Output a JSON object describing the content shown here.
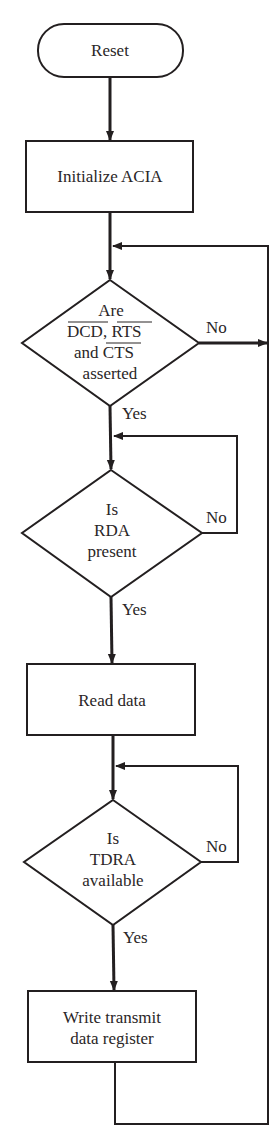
{
  "diagram": {
    "type": "flowchart",
    "nodes": {
      "reset": {
        "label": "Reset"
      },
      "init": {
        "label": "Initialize ACIA"
      },
      "decision1": {
        "line1": "Are",
        "line2a": "DCD",
        "line2b": ", ",
        "line2c": "RTS",
        "line3a": "and ",
        "line3b": "CTS",
        "line4": "asserted",
        "overlined": [
          "DCD",
          "RTS",
          "CTS"
        ]
      },
      "decision2": {
        "line1": "Is",
        "line2": "RDA",
        "line3": "present"
      },
      "read": {
        "label": "Read data"
      },
      "decision3": {
        "line1": "Is",
        "line2": "TDRA",
        "line3": "available"
      },
      "write": {
        "line1": "Write transmit",
        "line2": "data register"
      }
    },
    "edges": {
      "d1_no": "No",
      "d1_yes": "Yes",
      "d2_no": "No",
      "d2_yes": "Yes",
      "d3_no": "No",
      "d3_yes": "Yes"
    },
    "colors": {
      "ink": "#231f20",
      "background": "#ffffff"
    }
  }
}
